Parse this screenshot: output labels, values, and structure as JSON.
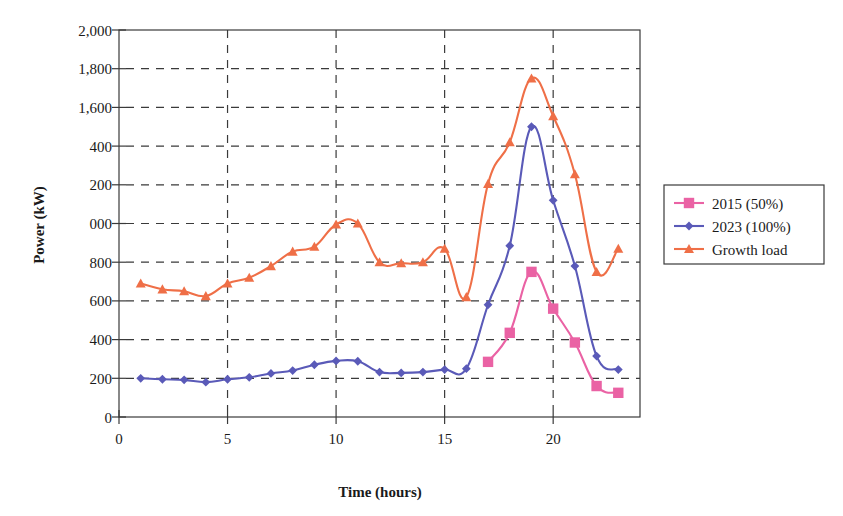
{
  "chart_data": {
    "type": "line",
    "title": "",
    "xlabel": "Time (hours)",
    "ylabel": "Power (kW)",
    "xlim": [
      0,
      24
    ],
    "ylim": [
      0,
      2000
    ],
    "xticks": [
      0,
      5,
      10,
      15,
      20
    ],
    "xtick_labels": [
      "0",
      "5",
      "10",
      "15",
      "20"
    ],
    "yticks": [
      0,
      200,
      400,
      600,
      800,
      1000,
      1200,
      1400,
      1600,
      1800,
      2000
    ],
    "ytick_labels": [
      "0",
      "200",
      "400",
      "600",
      "800",
      "000",
      "200",
      "400",
      "1,600",
      "1,800",
      "2,000"
    ],
    "grid": true,
    "grid_style": "dashed",
    "legend_position": "right-outside",
    "series": [
      {
        "name": "2015 (50%)",
        "color": "#ea62a4",
        "marker": "square",
        "x": [
          17,
          18,
          19,
          20,
          21,
          22,
          23
        ],
        "values": [
          285,
          435,
          750,
          560,
          385,
          160,
          125
        ]
      },
      {
        "name": "2023 (100%)",
        "color": "#5a5ab8",
        "marker": "diamond",
        "x": [
          1,
          2,
          3,
          4,
          5,
          6,
          7,
          8,
          9,
          10,
          11,
          12,
          13,
          14,
          15,
          16,
          17,
          18,
          19,
          20,
          21,
          22,
          23
        ],
        "values": [
          200,
          195,
          192,
          180,
          195,
          205,
          225,
          240,
          270,
          290,
          288,
          232,
          228,
          232,
          245,
          250,
          580,
          885,
          1500,
          1120,
          780,
          315,
          245
        ]
      },
      {
        "name": "Growth load",
        "color": "#ef6f47",
        "marker": "triangle",
        "x": [
          1,
          2,
          3,
          4,
          5,
          6,
          7,
          8,
          9,
          10,
          11,
          12,
          13,
          14,
          15,
          16,
          17,
          18,
          19,
          20,
          21,
          22,
          23
        ],
        "values": [
          690,
          660,
          650,
          625,
          690,
          720,
          780,
          855,
          880,
          995,
          1000,
          800,
          795,
          800,
          870,
          620,
          1205,
          1420,
          1750,
          1555,
          1255,
          750,
          870
        ]
      }
    ]
  },
  "legend": {
    "entries": [
      {
        "label": "2015 (50%)"
      },
      {
        "label": "2023 (100%)"
      },
      {
        "label": "Growth load"
      }
    ]
  }
}
